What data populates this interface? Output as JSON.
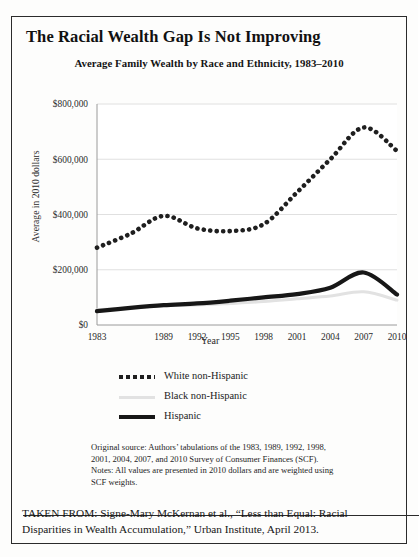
{
  "figure": {
    "title": "The Racial Wealth Gap Is Not Improving",
    "subtitle": "Average Family Wealth by Race and Ethnicity, 1983–2010",
    "notes_line1": "Original source: Authors’ tabulations of the 1983, 1989, 1992, 1998,",
    "notes_line2": "2001, 2004, 2007, and 2010 Survey of Consumer Finances (SCF).",
    "notes_line3": "Notes: All values are presented in 2010 dollars and are weighted using",
    "notes_line4": "SCF weights.",
    "taken_from": "TAKEN FROM: Signe-Mary McKernan et al., “Less than Equal: Racial Disparities in Wealth Accumulation,” Urban Institute, April 2013."
  },
  "chart_data": {
    "type": "line",
    "title": "Average Family Wealth by Race and Ethnicity, 1983–2010",
    "xlabel": "Year",
    "ylabel": "Average in 2010 dollars",
    "xlim": [
      1983,
      2010
    ],
    "ylim": [
      0,
      800000
    ],
    "grid": true,
    "grid_axis": "y",
    "legend_position": "below",
    "xtick_labels": [
      "1983",
      "1989",
      "1992",
      "1995",
      "1998",
      "2001",
      "2004",
      "2007",
      "2010"
    ],
    "xticks": [
      1983,
      1989,
      1992,
      1995,
      1998,
      2001,
      2004,
      2007,
      2010
    ],
    "ytick_labels": [
      "$0",
      "$200,000",
      "$400,000",
      "$600,000",
      "$800,000"
    ],
    "yticks": [
      0,
      200000,
      400000,
      600000,
      800000
    ],
    "x": [
      1983,
      1986,
      1989,
      1992,
      1995,
      1998,
      2001,
      2004,
      2007,
      2010
    ],
    "series": [
      {
        "name": "White non-Hispanic",
        "style": "dotted",
        "color": "#1f1f1f",
        "values": [
          280000,
          330000,
          395000,
          350000,
          340000,
          365000,
          480000,
          600000,
          715000,
          630000
        ]
      },
      {
        "name": "Black non-Hispanic",
        "style": "light-solid",
        "color": "#e2e2e2",
        "values": [
          55000,
          62000,
          70000,
          72000,
          78000,
          85000,
          95000,
          105000,
          120000,
          90000
        ]
      },
      {
        "name": "Hispanic",
        "style": "thick-solid",
        "color": "#171717",
        "values": [
          50000,
          62000,
          72000,
          78000,
          88000,
          100000,
          112000,
          135000,
          190000,
          110000
        ]
      }
    ]
  }
}
